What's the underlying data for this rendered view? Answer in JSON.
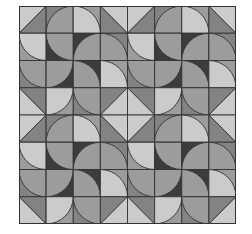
{
  "image": {
    "description": "Quilt-like tiled pattern of quarter circles and half-square triangles in shades of gray",
    "grid": {
      "rows": 8,
      "cols": 8,
      "block_rows": 4,
      "block_cols": 4
    },
    "colors": {
      "light": "#cbcbcb",
      "medium": "#9c9c9c",
      "mediumdark": "#838383",
      "dark": "#3c3c3c",
      "line": "#333333"
    },
    "block": [
      [
        {
          "type": "tri",
          "diag": "bl-tr",
          "a": "light",
          "b": "mediumdark"
        },
        {
          "type": "arc",
          "center": "br",
          "fill": "medium",
          "bg": "mediumdark"
        },
        {
          "type": "arc",
          "center": "bl",
          "fill": "light",
          "bg": "medium"
        },
        {
          "type": "tri",
          "diag": "tl-br",
          "a": "light",
          "b": "mediumdark"
        }
      ],
      [
        {
          "type": "arc",
          "center": "tr",
          "fill": "light",
          "bg": "medium"
        },
        {
          "type": "arc",
          "center": "tr",
          "fill": "medium",
          "bg": "dark"
        },
        {
          "type": "arc",
          "center": "br",
          "fill": "medium",
          "bg": "dark"
        },
        {
          "type": "arc",
          "center": "bl",
          "fill": "medium",
          "bg": "mediumdark"
        }
      ],
      [
        {
          "type": "arc",
          "center": "tr",
          "fill": "medium",
          "bg": "mediumdark"
        },
        {
          "type": "arc",
          "center": "tl",
          "fill": "medium",
          "bg": "dark"
        },
        {
          "type": "arc",
          "center": "bl",
          "fill": "medium",
          "bg": "dark"
        },
        {
          "type": "arc",
          "center": "bl",
          "fill": "light",
          "bg": "medium"
        }
      ],
      [
        {
          "type": "tri",
          "diag": "tl-br",
          "a": "mediumdark",
          "b": "light"
        },
        {
          "type": "arc",
          "center": "tl",
          "fill": "light",
          "bg": "medium"
        },
        {
          "type": "arc",
          "center": "tr",
          "fill": "medium",
          "bg": "mediumdark"
        },
        {
          "type": "tri",
          "diag": "bl-tr",
          "a": "mediumdark",
          "b": "light"
        }
      ]
    ]
  }
}
